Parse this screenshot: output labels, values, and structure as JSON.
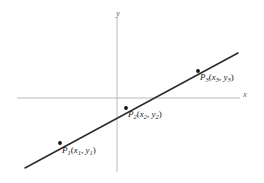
{
  "figure": {
    "type": "line-graph-diagram",
    "background_color": "#ffffff",
    "axes": {
      "x_label": "x",
      "y_label": "y",
      "axis_color": "#bbbbbb",
      "x_axis": {
        "y": 98,
        "x_start": 17,
        "x_end": 240
      },
      "y_axis": {
        "x": 117,
        "y_start": 17,
        "y_end": 172
      }
    },
    "line": {
      "color": "#2b2b2b",
      "width": 1.5,
      "start": {
        "x": 25,
        "y": 168
      },
      "end": {
        "x": 238,
        "y": 53
      }
    },
    "points": [
      {
        "id": "P1",
        "name": "P",
        "subscript": "1",
        "coord_x": "x",
        "coord_x_sub": "1",
        "coord_y": "y",
        "coord_y_sub": "1",
        "open_paren": "(",
        "comma": ",",
        "close_paren": ")",
        "dot": {
          "x": 60,
          "y": 143
        },
        "dot_color": "#111111"
      },
      {
        "id": "P2",
        "name": "P",
        "subscript": "2",
        "coord_x": "x",
        "coord_x_sub": "2",
        "coord_y": "y",
        "coord_y_sub": "2",
        "open_paren": "(",
        "comma": ",",
        "close_paren": ")",
        "dot": {
          "x": 126,
          "y": 108
        },
        "dot_color": "#111111"
      },
      {
        "id": "P3",
        "name": "P",
        "subscript": "3",
        "coord_x": "x",
        "coord_x_sub": "3",
        "coord_y": "y",
        "coord_y_sub": "3",
        "dot": {
          "x": 198,
          "y": 71
        },
        "open_paren": "(",
        "comma": ",",
        "close_paren": ")",
        "dot_color": "#111111"
      }
    ]
  }
}
